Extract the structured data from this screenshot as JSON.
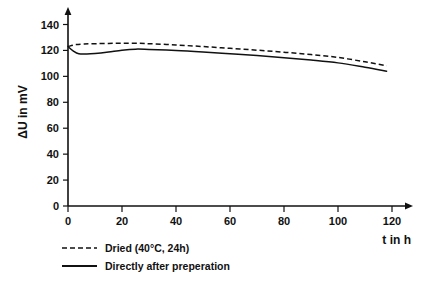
{
  "chart_data": {
    "type": "line",
    "title": "",
    "subtitle": "",
    "xlabel": "t in h",
    "ylabel": "ΔU in mV",
    "xlim": [
      0,
      130
    ],
    "ylim": [
      0,
      145
    ],
    "xticks": [
      0,
      20,
      40,
      60,
      80,
      100,
      120
    ],
    "yticks": [
      0,
      20,
      40,
      60,
      80,
      100,
      120,
      140
    ],
    "xtick_labels": [
      "0",
      "20",
      "40",
      "60",
      "80",
      "100",
      "120"
    ],
    "ytick_labels": [
      "0",
      "20",
      "40",
      "60",
      "80",
      "100",
      "120",
      "140"
    ],
    "grid": false,
    "legend_position": "below-left",
    "axis_arrows": true,
    "series": [
      {
        "name": "Dried (40°C, 24h)",
        "style": "dashed",
        "color": "#111111",
        "x": [
          0,
          3,
          6,
          10,
          15,
          20,
          25,
          30,
          40,
          50,
          60,
          70,
          80,
          90,
          100,
          110,
          118
        ],
        "values": [
          123,
          124.5,
          125,
          125.2,
          125.4,
          125.5,
          125.5,
          125.2,
          124.2,
          123.0,
          121.6,
          120.2,
          118.6,
          116.8,
          114.6,
          111.2,
          108.2
        ]
      },
      {
        "name": "Directly after preperation",
        "style": "solid",
        "color": "#111111",
        "x": [
          0,
          2,
          4,
          7,
          10,
          15,
          20,
          25,
          30,
          40,
          50,
          60,
          70,
          80,
          90,
          100,
          110,
          118
        ],
        "values": [
          123,
          119.5,
          117.4,
          117.2,
          117.6,
          118.8,
          120.2,
          121.0,
          120.8,
          120.0,
          118.8,
          117.4,
          116.0,
          114.4,
          112.6,
          110.4,
          107.0,
          104.0
        ]
      }
    ],
    "legend": [
      {
        "label": "Dried (40°C, 24h)",
        "style": "dashed"
      },
      {
        "label": "Directly after preperation",
        "style": "solid"
      }
    ]
  }
}
